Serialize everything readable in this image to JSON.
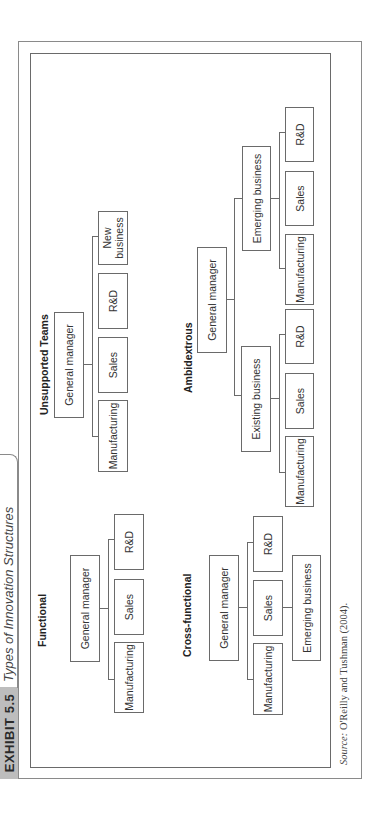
{
  "exhibit": {
    "tag": "EXHIBIT 5.5",
    "title": "Types of Innovation Structures"
  },
  "diagrams": {
    "functional": {
      "title": "Functional",
      "root": "General manager",
      "children": [
        "Manufacturing",
        "Sales",
        "R&D"
      ]
    },
    "unsupported_teams": {
      "title": "Unsupported Teams",
      "root": "General manager",
      "children": [
        "Manufacturing",
        "Sales",
        "R&D",
        "New business"
      ]
    },
    "cross_functional": {
      "title": "Cross-functional",
      "root": "General manager",
      "children": [
        "Manufacturing",
        "Sales",
        "R&D"
      ],
      "sub_unit": "Emerging business"
    },
    "ambidextrous": {
      "title": "Ambidextrous",
      "root": "General manager",
      "units": [
        {
          "label": "Existing business",
          "children": [
            "Manufacturing",
            "Sales",
            "R&D"
          ]
        },
        {
          "label": "Emerging business",
          "children": [
            "Manufacturing",
            "Sales",
            "R&D"
          ]
        }
      ]
    }
  },
  "source": {
    "prefix": "Source:",
    "text": "O'Reilly and Tushman (2004)."
  }
}
